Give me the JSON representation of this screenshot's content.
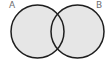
{
  "diagram": {
    "type": "venn",
    "sets": [
      {
        "label": "A",
        "cx": 37.5,
        "cy": 31.5,
        "r": 26.5
      },
      {
        "label": "B",
        "cx": 77.5,
        "cy": 31.5,
        "r": 26.5
      }
    ],
    "colors": {
      "fill": "#e6e6e6",
      "stroke": "#1e1e1e",
      "label": "#6e6e6e",
      "background": "#ffffff"
    }
  }
}
